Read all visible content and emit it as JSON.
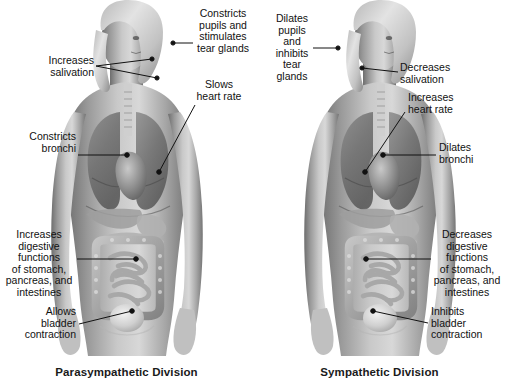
{
  "diagram": {
    "type": "anatomical-comparison",
    "background_color": "#ffffff",
    "text_color": "#111111",
    "leader_line_color": "#111111",
    "width": 506,
    "height": 387
  },
  "panels": [
    {
      "id": "parasympathetic",
      "caption": "Parasympathetic Division",
      "labels": [
        {
          "name": "increases-salivation",
          "text": "Increases\nsalivation",
          "target_organ": "salivary-glands",
          "align": "right"
        },
        {
          "name": "constricts-pupils-tear-glands",
          "text": "Constricts\npupils and\nstimulates\ntear glands",
          "target_organ": "eye-and-tear-glands",
          "align": "center"
        },
        {
          "name": "slows-heart-rate",
          "text": "Slows\nheart rate",
          "target_organ": "heart",
          "align": "center"
        },
        {
          "name": "constricts-bronchi",
          "text": "Constricts\nbronchi",
          "target_organ": "lungs-bronchi",
          "align": "right"
        },
        {
          "name": "increases-digestion",
          "text": "Increases\ndigestive\nfunctions\nof stomach,\npancreas, and\nintestines",
          "target_organ": "stomach-pancreas-intestines",
          "align": "center"
        },
        {
          "name": "allows-bladder-contraction",
          "text": "Allows\nbladder\ncontraction",
          "target_organ": "bladder",
          "align": "right"
        }
      ]
    },
    {
      "id": "sympathetic",
      "caption": "Sympathetic Division",
      "labels": [
        {
          "name": "dilates-pupils-inhibits-tear-glands",
          "text": "Dilates\npupils\nand\ninhibits\ntear\nglands",
          "target_organ": "eye-and-tear-glands",
          "align": "center"
        },
        {
          "name": "decreases-salivation",
          "text": "Decreases\nsalivation",
          "target_organ": "salivary-glands",
          "align": "left"
        },
        {
          "name": "increases-heart-rate",
          "text": "Increases\nheart rate",
          "target_organ": "heart",
          "align": "left"
        },
        {
          "name": "dilates-bronchi",
          "text": "Dilates\nbronchi",
          "target_organ": "lungs-bronchi",
          "align": "left"
        },
        {
          "name": "decreases-digestion",
          "text": "Decreases\ndigestive\nfunctions\nof stomach,\npancreas, and\nintestines",
          "target_organ": "stomach-pancreas-intestines",
          "align": "center"
        },
        {
          "name": "inhibits-bladder-contraction",
          "text": "Inhibits\nbladder\ncontraction",
          "target_organ": "bladder",
          "align": "left"
        }
      ]
    }
  ]
}
